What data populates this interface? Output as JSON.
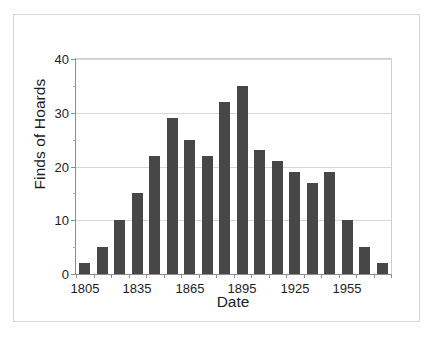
{
  "chart_data": {
    "type": "bar",
    "title": "",
    "xlabel": "Date",
    "ylabel": "Finds of Hoards",
    "categories": [
      "1805",
      "1815",
      "1825",
      "1835",
      "1845",
      "1855",
      "1865",
      "1875",
      "1885",
      "1895",
      "1905",
      "1915",
      "1925",
      "1935",
      "1945",
      "1955",
      "1965",
      "1975"
    ],
    "values": [
      2,
      5,
      10,
      15,
      22,
      29,
      25,
      22,
      32,
      35,
      23,
      21,
      19,
      17,
      19,
      10,
      5,
      2
    ],
    "xlim": [
      1800,
      1980
    ],
    "ylim": [
      0,
      40
    ],
    "y_major_ticks": [
      0,
      10,
      20,
      30,
      40
    ],
    "y_minor_ticks": [
      5,
      15,
      25,
      35
    ],
    "y_tick_labels": [
      "0",
      "10",
      "20",
      "30",
      "40"
    ],
    "x_tick_labels": [
      "1805",
      "1835",
      "1865",
      "1895",
      "1925",
      "1955"
    ],
    "x_labeled_indices": [
      0,
      3,
      6,
      9,
      12,
      15
    ],
    "grid": "horizontal",
    "legend": "none",
    "bar_color": "#474747",
    "gridline_color": "#d8d8d8",
    "axis_color": "#8c8c8c",
    "text_color": "#1c1c1c",
    "frame_color": "#d4d4d4",
    "background": "#ffffff"
  }
}
